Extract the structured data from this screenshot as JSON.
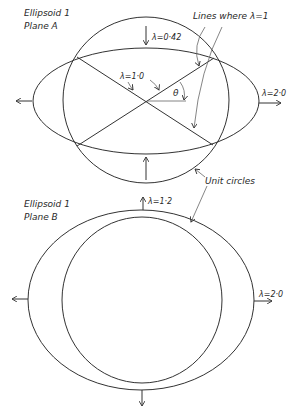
{
  "planeA": {
    "title_line1": "Ellipsoid 1",
    "title_line2": "Plane A",
    "lambda_top": "λ=0·42",
    "lambda_right": "λ=2·0",
    "lambda_diag": "λ=1·0",
    "theta": "θ",
    "lines_label": "Lines where λ=1"
  },
  "planeB": {
    "title_line1": "Ellipsoid 1",
    "title_line2": "Plane B",
    "lambda_top": "λ=1·2",
    "lambda_right": "λ=2·0",
    "unit_label": "Unit circles"
  },
  "colors": {
    "ink": "#333333",
    "background": "#ffffff"
  }
}
